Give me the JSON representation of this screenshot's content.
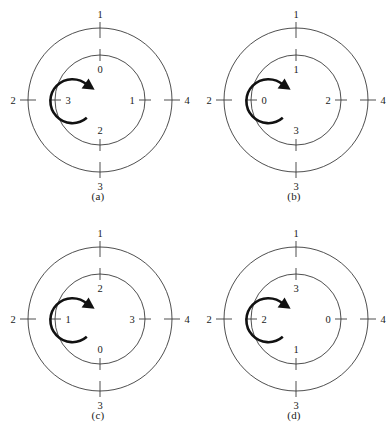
{
  "figure": {
    "type": "concentric-dial-diagram-set",
    "background_color": "#ffffff",
    "stroke_color": "#3b3b3b",
    "arrow_color": "#111111",
    "text_color": "#1a1a1a",
    "geometry": {
      "center_x": 100,
      "center_y": 100,
      "outer_radius": 72,
      "inner_radius": 45,
      "tick_overhang": 6,
      "arrow_radius": 22,
      "arrow_direction": "counterclockwise"
    },
    "panels": [
      {
        "caption": "(a)",
        "outer_labels": {
          "top": "1",
          "right": "4",
          "bottom": "3",
          "left": "2"
        },
        "inner_labels": {
          "top": "0",
          "right": "1",
          "bottom": "2",
          "left": "3"
        },
        "arrow": "counterclockwise"
      },
      {
        "caption": "(b)",
        "outer_labels": {
          "top": "1",
          "right": "4",
          "bottom": "3",
          "left": "2"
        },
        "inner_labels": {
          "top": "1",
          "right": "2",
          "bottom": "3",
          "left": "0"
        },
        "arrow": "counterclockwise"
      },
      {
        "caption": "(c)",
        "outer_labels": {
          "top": "1",
          "right": "4",
          "bottom": "3",
          "left": "2"
        },
        "inner_labels": {
          "top": "2",
          "right": "3",
          "bottom": "0",
          "left": "1"
        },
        "arrow": "counterclockwise"
      },
      {
        "caption": "(d)",
        "outer_labels": {
          "top": "1",
          "right": "4",
          "bottom": "3",
          "left": "2"
        },
        "inner_labels": {
          "top": "3",
          "right": "0",
          "bottom": "1",
          "left": "2"
        },
        "arrow": "counterclockwise"
      }
    ]
  }
}
